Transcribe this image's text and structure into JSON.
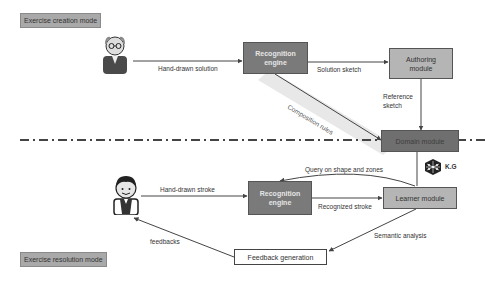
{
  "modes": {
    "creation": "Exercise creation mode",
    "resolution": "Exercise resolution mode"
  },
  "actors": {
    "teacher": "teacher-icon",
    "learner": "learner-icon"
  },
  "boxes": {
    "recognition_top": [
      "Recognition",
      "engine"
    ],
    "authoring": [
      "Authoring",
      "module"
    ],
    "domain": "Domain module",
    "recognition_bottom": [
      "Recognition",
      "engine"
    ],
    "learner": "Learner module",
    "feedback": "Feedback generation"
  },
  "edges": {
    "hand_drawn_solution": "Hand-drawn solution",
    "solution_sketch": "Solution sketch",
    "reference_sketch": [
      "Reference",
      "sketch"
    ],
    "composition_rules": "Composition rules",
    "query": "Query on shape and zones",
    "hand_drawn_stroke": "Hand-drawn stroke",
    "recognized_stroke": "Recognized stroke",
    "semantic_analysis": "Semantic analysis",
    "feedbacks": "feedbacks"
  },
  "kg": {
    "label": "K.G",
    "icon": "knowledge-graph-icon"
  },
  "colors": {
    "dark_box": "#7a7a7a",
    "mid_box": "#b5b5b5",
    "domain_box": "#6f6f6f",
    "mode_label": "#a9a9a9",
    "line": "#444444"
  }
}
